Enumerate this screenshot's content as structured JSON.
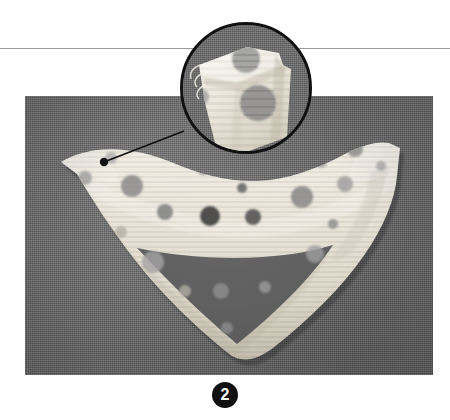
{
  "page": {
    "width": 450,
    "height": 420,
    "background_color": "#ffffff"
  },
  "rule": {
    "name": "horizontal-rule",
    "color": "#9a9a9a",
    "y": 48
  },
  "photo": {
    "name": "instructional-photo",
    "alt_text": "Polka dot collar bib laid flat on grey fabric background",
    "x": 25,
    "y": 96,
    "width": 408,
    "height": 279,
    "background_color": "#6c6c6c",
    "subject": {
      "name": "polka-dot-collar",
      "fabric_color": "#ece7dc",
      "shadow_color": "#bdb6a8",
      "dot_colors": [
        "#8d8d8d",
        "#a5a5a5",
        "#6f6f6f",
        "#444444",
        "#c0bcb2"
      ],
      "dots": [
        {
          "cx": 178,
          "cy": 74,
          "r": 5,
          "fill": "#8f8f8f"
        },
        {
          "cx": 247,
          "cy": 62,
          "r": 7,
          "fill": "#9a9a9a"
        },
        {
          "cx": 296,
          "cy": 66,
          "r": 6,
          "fill": "#a0a0a0"
        },
        {
          "cx": 330,
          "cy": 53,
          "r": 8,
          "fill": "#909090"
        },
        {
          "cx": 356,
          "cy": 70,
          "r": 5,
          "fill": "#a8a8a8"
        },
        {
          "cx": 60,
          "cy": 82,
          "r": 7,
          "fill": "#a3a3a3"
        },
        {
          "cx": 86,
          "cy": 62,
          "r": 6,
          "fill": "#adadad"
        },
        {
          "cx": 107,
          "cy": 90,
          "r": 11,
          "fill": "#8a8a8a"
        },
        {
          "cx": 140,
          "cy": 116,
          "r": 8,
          "fill": "#7f7f7f"
        },
        {
          "cx": 185,
          "cy": 120,
          "r": 10,
          "fill": "#3b3b3b"
        },
        {
          "cx": 228,
          "cy": 121,
          "r": 8,
          "fill": "#4d4d4d"
        },
        {
          "cx": 217,
          "cy": 92,
          "r": 5,
          "fill": "#636363"
        },
        {
          "cx": 277,
          "cy": 101,
          "r": 11,
          "fill": "#868686"
        },
        {
          "cx": 320,
          "cy": 88,
          "r": 8,
          "fill": "#9d9d9d"
        },
        {
          "cx": 308,
          "cy": 128,
          "r": 5,
          "fill": "#8b8b8b"
        },
        {
          "cx": 290,
          "cy": 158,
          "r": 9,
          "fill": "#9e9e9e"
        },
        {
          "cx": 96,
          "cy": 136,
          "r": 6,
          "fill": "#b4b0a6"
        },
        {
          "cx": 128,
          "cy": 166,
          "r": 11,
          "fill": "#a2a2a2"
        },
        {
          "cx": 160,
          "cy": 195,
          "r": 6,
          "fill": "#b0aca2"
        },
        {
          "cx": 196,
          "cy": 195,
          "r": 8,
          "fill": "#8e8e8e"
        },
        {
          "cx": 240,
          "cy": 191,
          "r": 6,
          "fill": "#9b9b9b"
        },
        {
          "cx": 202,
          "cy": 232,
          "r": 6,
          "fill": "#8f8f8f"
        },
        {
          "cx": 275,
          "cy": 47,
          "r": 4,
          "fill": "#9c9c9c"
        }
      ]
    }
  },
  "magnifier": {
    "name": "magnifier-callout",
    "center_x": 246,
    "center_y": 88,
    "radius": 66,
    "border_color": "#111111",
    "border_width": 3,
    "detail_description": "Close-up of the collar edge seam and large printed polka dots",
    "detail_dots": [
      {
        "cx": 63,
        "cy": 34,
        "r": 14,
        "fill": "#9a9a9a"
      },
      {
        "cx": 75,
        "cy": 78,
        "r": 18,
        "fill": "#8c8c8c"
      },
      {
        "cx": 18,
        "cy": 72,
        "r": 8,
        "fill": "#a4a4a4"
      }
    ]
  },
  "leader": {
    "name": "leader-line",
    "color": "#111111",
    "anchor_dot_x": 104,
    "anchor_dot_y": 162,
    "anchor_dot_radius": 4,
    "end_x": 184,
    "end_y": 131
  },
  "caption": {
    "name": "figure-caption",
    "figure_number": "2",
    "badge_shape": "filled-circle",
    "badge_color": "#111111",
    "badge_text_color": "#ffffff"
  }
}
